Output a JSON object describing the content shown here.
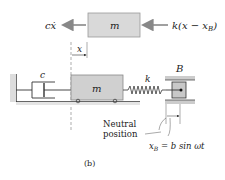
{
  "figure": {
    "caption": "(b)",
    "free_body": {
      "mass_label": "m",
      "left_force": "cẋ",
      "right_force": "k(x − x",
      "right_force_sub": "B",
      "right_force_close": ")",
      "displacement_label": "x"
    },
    "system": {
      "damper_label": "c",
      "mass_label": "m",
      "spring_label": "k",
      "support_label": "B",
      "neutral_position_line1": "Neutral",
      "neutral_position_line2": "position",
      "xb_lhs": "x",
      "xb_sub": "B",
      "xb_rhs": " = b sin ωt"
    },
    "colors": {
      "mass_fill": "#d9d9d9",
      "arrow": "#888888",
      "line": "#333333",
      "support_fill": "#cccccc"
    }
  }
}
